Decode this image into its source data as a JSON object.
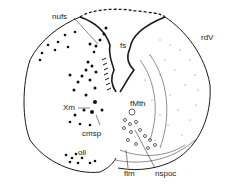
{
  "figure": {
    "type": "brainstem-cross-section",
    "colors": {
      "ink": "#1a1a1a",
      "background": "#ffffff"
    },
    "labels": [
      {
        "id": "nufs",
        "text": "nufs",
        "x": 52,
        "y": 13
      },
      {
        "id": "fs",
        "text": "fs",
        "x": 121,
        "y": 42
      },
      {
        "id": "rdV",
        "text": "rdV",
        "x": 201,
        "y": 34
      },
      {
        "id": "Xm",
        "text": "Xm",
        "x": 64,
        "y": 105
      },
      {
        "id": "fMth",
        "text": "fMth",
        "x": 130,
        "y": 101
      },
      {
        "id": "cmsp",
        "text": "cmsp",
        "x": 82,
        "y": 130
      },
      {
        "id": "oli",
        "text": "oli",
        "x": 78,
        "y": 149
      },
      {
        "id": "flm",
        "text": "flm",
        "x": 124,
        "y": 170
      },
      {
        "id": "nspoc",
        "text": "nspoc",
        "x": 155,
        "y": 170
      }
    ]
  }
}
